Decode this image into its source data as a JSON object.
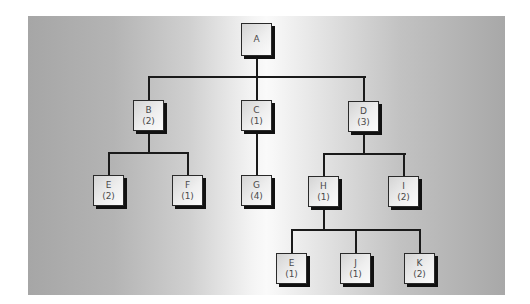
{
  "diagram": {
    "type": "tree",
    "background": {
      "edge_color": "#a6a6a6",
      "center_color": "#fafafa"
    },
    "colors": {
      "line": "#1a1a1a",
      "node_border": "#2a2a2a",
      "node_shadow": "#111111",
      "node_text": "#4a4a4a"
    },
    "nodes": {
      "a": {
        "label": "A",
        "count": ""
      },
      "b": {
        "label": "B",
        "count": "(2)"
      },
      "c": {
        "label": "C",
        "count": "(1)"
      },
      "d": {
        "label": "D",
        "count": "(3)"
      },
      "e1": {
        "label": "E",
        "count": "(2)"
      },
      "f": {
        "label": "F",
        "count": "(1)"
      },
      "g": {
        "label": "G",
        "count": "(4)"
      },
      "h": {
        "label": "H",
        "count": "(1)"
      },
      "i": {
        "label": "I",
        "count": "(2)"
      },
      "e2": {
        "label": "E",
        "count": "(1)"
      },
      "j": {
        "label": "J",
        "count": "(1)"
      },
      "k": {
        "label": "K",
        "count": "(2)"
      }
    },
    "edges": [
      [
        "A",
        "B"
      ],
      [
        "A",
        "C"
      ],
      [
        "A",
        "D"
      ],
      [
        "B",
        "E"
      ],
      [
        "B",
        "F"
      ],
      [
        "C",
        "G"
      ],
      [
        "D",
        "H"
      ],
      [
        "D",
        "I"
      ],
      [
        "H",
        "E"
      ],
      [
        "H",
        "J"
      ],
      [
        "H",
        "K"
      ]
    ]
  }
}
